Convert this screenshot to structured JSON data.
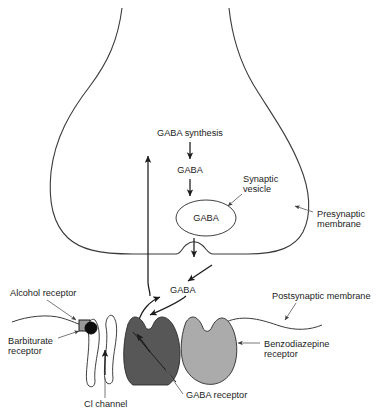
{
  "figure": {
    "background_color": "#ffffff",
    "line_color": "#3a3a3a",
    "text_color": "#1c1c1c"
  },
  "colors": {
    "gaba_receptor_fill": "#575757",
    "benzodiazepine_receptor_fill": "#ababab",
    "cl_channel_fill": "#ffffff",
    "alcohol_receptor_fill": "#9a9a9a",
    "barbiturate_receptor_fill": "#0d0d0d",
    "vesicle_fill": "#ffffff",
    "leader_color": "#6a6a6a"
  },
  "labels": {
    "gaba_synthesis": "GABA synthesis",
    "gaba_transmitter": "GABA",
    "gaba_vesicle_content": "GABA",
    "gaba_cleft": "GABA",
    "synaptic_vesicle_line1": "Synaptic",
    "synaptic_vesicle_line2": "vesicle",
    "presynaptic_membrane_line1": "Presynaptic",
    "presynaptic_membrane_line2": "membrane",
    "postsynaptic_membrane": "Postsynaptic membrane",
    "alcohol_receptor": "Alcohol receptor",
    "barbiturate_receptor_line1": "Barbiturate",
    "barbiturate_receptor_line2": "receptor",
    "benzodiazepine_receptor_line1": "Benzodiazepine",
    "benzodiazepine_receptor_line2": "receptor",
    "gaba_receptor": "GABA receptor",
    "cl_channel": "Cl channel"
  }
}
